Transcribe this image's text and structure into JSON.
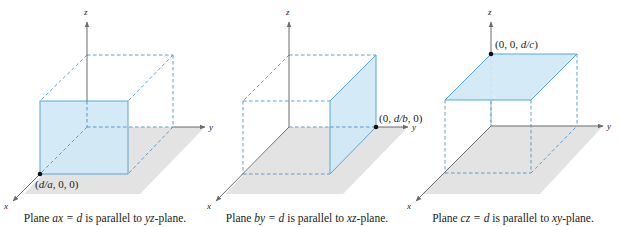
{
  "colors": {
    "plane_fill": "#cfe8f6",
    "plane_edge": "#5aa6d6",
    "dashed_edge": "#4b95c9",
    "floor": "#e3e3e3",
    "axis": "#6b6b6b",
    "point": "#111111"
  },
  "panels": [
    {
      "id": "yz",
      "axis_labels": {
        "x": "x",
        "y": "y",
        "z": "z"
      },
      "point_label": "(d/a, 0, 0)",
      "point_label_parts": [
        "(",
        "d/a",
        ", 0, 0)"
      ],
      "caption": {
        "pre": "Plane ",
        "eq": "ax = d",
        "mid": " is parallel to ",
        "plane": "yz",
        "post": "-plane."
      }
    },
    {
      "id": "xz",
      "axis_labels": {
        "x": "x",
        "y": "y",
        "z": "z"
      },
      "point_label": "(0, d/b, 0)",
      "point_label_parts": [
        "(0, ",
        "d/b",
        ", 0)"
      ],
      "caption": {
        "pre": "Plane ",
        "eq": "by = d",
        "mid": " is parallel to ",
        "plane": "xz",
        "post": "-plane."
      }
    },
    {
      "id": "xy",
      "axis_labels": {
        "x": "x",
        "y": "y",
        "z": "z"
      },
      "point_label": "(0, 0, d/c)",
      "point_label_parts": [
        "(0, 0, ",
        "d/c",
        ")"
      ],
      "caption": {
        "pre": "Plane ",
        "eq": "cz = d",
        "mid": " is parallel to ",
        "plane": "xy",
        "post": "-plane."
      }
    }
  ]
}
